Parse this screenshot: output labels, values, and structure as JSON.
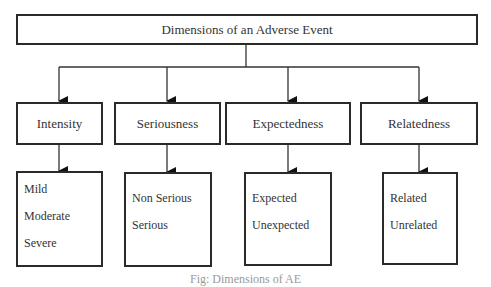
{
  "title": "Dimensions of an Adverse Event",
  "categories": [
    {
      "label": "Intensity",
      "items": [
        "Mild",
        "Moderate",
        "Severe"
      ]
    },
    {
      "label": "Seriousness",
      "items": [
        "Non Serious",
        "Serious"
      ]
    },
    {
      "label": "Expectedness",
      "items": [
        "Expected",
        "Unexpected"
      ]
    },
    {
      "label": "Relatedness",
      "items": [
        "Related",
        "Unrelated"
      ]
    }
  ],
  "caption": "Fig: Dimensions of AE"
}
